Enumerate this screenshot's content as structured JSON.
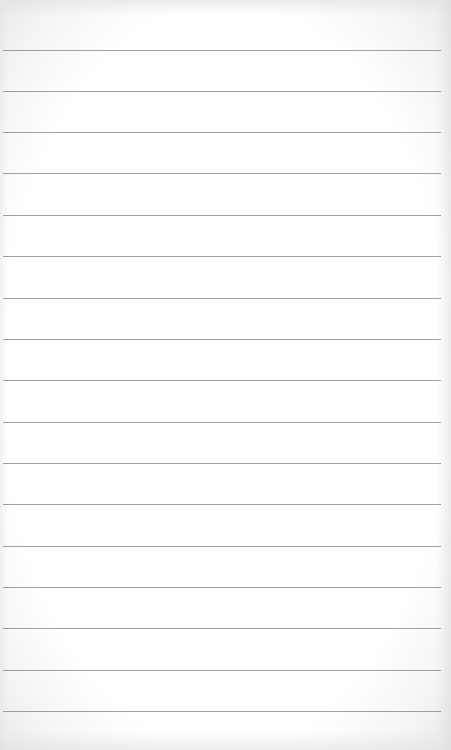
{
  "paper": {
    "type": "lined-notepaper",
    "background_color": "#ffffff",
    "rule_color": "#8e8e8e",
    "rule_count": 17,
    "rule_spacing_px": 41.3,
    "rules_y": [
      50,
      91,
      132,
      173,
      215,
      256,
      298,
      339,
      380,
      422,
      463,
      504,
      546,
      587,
      628,
      670,
      711
    ]
  }
}
